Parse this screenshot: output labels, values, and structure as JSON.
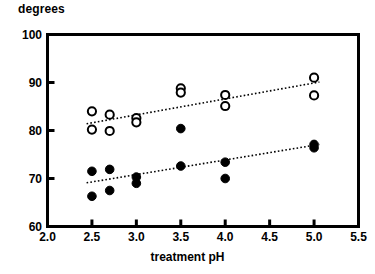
{
  "chart_data": {
    "type": "scatter",
    "title": "",
    "subtitle": "",
    "xlabel": "treatment pH",
    "ylabel": "degrees",
    "xlim": [
      2.0,
      5.5
    ],
    "ylim": [
      60,
      100
    ],
    "xticks": [
      "2.0",
      "2.5",
      "3.0",
      "3.5",
      "4.0",
      "4.5",
      "5.0",
      "5.5"
    ],
    "xtick_values": [
      2.0,
      2.5,
      3.0,
      3.5,
      4.0,
      4.5,
      5.0,
      5.5
    ],
    "yticks": [
      "60",
      "70",
      "80",
      "90",
      "100"
    ],
    "ytick_values": [
      60,
      70,
      80,
      90,
      100
    ],
    "grid": false,
    "legend": "none",
    "series": [
      {
        "name": "open-circles",
        "marker": "open-circle",
        "color": "#000000",
        "points": [
          {
            "x": 2.5,
            "y": 84.0
          },
          {
            "x": 2.5,
            "y": 80.2
          },
          {
            "x": 2.7,
            "y": 83.3
          },
          {
            "x": 2.7,
            "y": 79.9
          },
          {
            "x": 3.0,
            "y": 82.6
          },
          {
            "x": 3.0,
            "y": 81.7
          },
          {
            "x": 3.5,
            "y": 88.8
          },
          {
            "x": 3.5,
            "y": 87.9
          },
          {
            "x": 4.0,
            "y": 87.4
          },
          {
            "x": 4.0,
            "y": 85.1
          },
          {
            "x": 5.0,
            "y": 91.0
          },
          {
            "x": 5.0,
            "y": 87.3
          }
        ],
        "trendline": {
          "x1": 2.44,
          "y1": 81.4,
          "x2": 5.06,
          "y2": 90.1,
          "style": "dotted"
        }
      },
      {
        "name": "filled-circles",
        "marker": "filled-circle",
        "color": "#000000",
        "points": [
          {
            "x": 2.5,
            "y": 71.5
          },
          {
            "x": 2.5,
            "y": 66.3
          },
          {
            "x": 2.7,
            "y": 71.9
          },
          {
            "x": 2.7,
            "y": 67.5
          },
          {
            "x": 3.0,
            "y": 70.3
          },
          {
            "x": 3.0,
            "y": 69.0
          },
          {
            "x": 3.5,
            "y": 80.4
          },
          {
            "x": 3.5,
            "y": 72.6
          },
          {
            "x": 4.0,
            "y": 73.4
          },
          {
            "x": 4.0,
            "y": 70.0
          },
          {
            "x": 5.0,
            "y": 77.1
          },
          {
            "x": 5.0,
            "y": 76.4
          }
        ],
        "trendline": {
          "x1": 2.44,
          "y1": 69.1,
          "x2": 5.06,
          "y2": 77.1,
          "style": "dotted"
        }
      }
    ]
  },
  "axes": {
    "frame_color": "#000000",
    "background": "#ffffff"
  }
}
